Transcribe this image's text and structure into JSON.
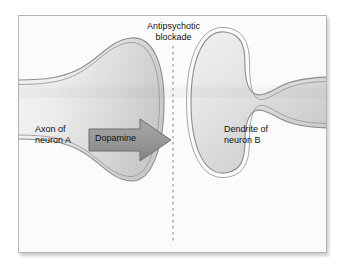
{
  "figure": {
    "kind": "synapse-diagram",
    "caption_title_line1": "Antipsychotic",
    "caption_title_line2": "blockade",
    "title_full": "Antipsychotic blockade"
  },
  "labels": {
    "title": "Antipsychotic\nblockade",
    "axon": "Axon of\nneuron A",
    "dendrite": "Dendrite of\nneuron B",
    "dopamine": "Dopamine"
  },
  "elements": {
    "presynaptic_neuron_name": "Axon of neuron A",
    "postsynaptic_neuron_name": "Dendrite of neuron B",
    "neurotransmitter": "Dopamine",
    "blockade_marker": "Antipsychotic blockade",
    "arrow_direction": "right",
    "blockade_line_style": "dashed-vertical"
  },
  "colors": {
    "page_background": "#ffffff",
    "panel_background": "#fbfbfb",
    "panel_border": "#b4b4b4",
    "membrane_line": "#8d8d8d",
    "cytoplasm_light": "#f2f2f2",
    "cytoplasm_mid": "#e2e2e2",
    "cytoplasm_dark": "#cdcdcd",
    "arrow_fill": "#9b9b9b",
    "arrow_edge": "#6f6f6f",
    "dashed_line": "#909090",
    "text": "#111111"
  }
}
